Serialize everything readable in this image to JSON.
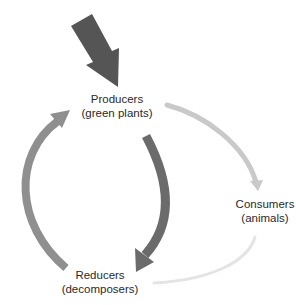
{
  "diagram": {
    "type": "nutrient-cycle",
    "nodes": {
      "producers": {
        "title": "Producers",
        "subtitle": "(green plants)"
      },
      "consumers": {
        "title": "Consumers",
        "subtitle": "(animals)"
      },
      "reducers": {
        "title": "Reducers",
        "subtitle": "(decomposers)"
      }
    },
    "arrows": [
      {
        "id": "energy-input",
        "from": "outside",
        "to": "producers",
        "color": "#555555"
      },
      {
        "id": "producers-to-consumers",
        "from": "producers",
        "to": "consumers",
        "color": "#c9c9c9"
      },
      {
        "id": "consumers-to-reducers",
        "from": "consumers",
        "to": "reducers",
        "color": "#e6e6e6"
      },
      {
        "id": "producers-to-reducers",
        "from": "producers",
        "to": "reducers",
        "color": "#6b6b6b"
      },
      {
        "id": "reducers-to-producers",
        "from": "reducers",
        "to": "producers",
        "color": "#8f8f8f"
      }
    ]
  }
}
